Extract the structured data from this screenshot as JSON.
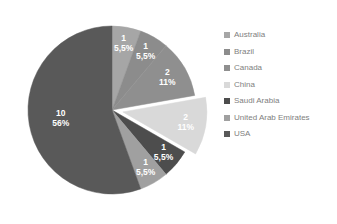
{
  "chart_data": {
    "type": "pie",
    "title": "",
    "subtitle": "",
    "xlabel": "",
    "ylabel": "",
    "legend_position": "right",
    "grid": false,
    "total": 18,
    "categories": [
      "Australia",
      "Brazil",
      "Canada",
      "China",
      "Saudi Arabia",
      "United Arab Emirates",
      "USA"
    ],
    "values": [
      1,
      1,
      2,
      2,
      1,
      1,
      10
    ],
    "percent_labels": [
      "5,5%",
      "5,5%",
      "11%",
      "11%",
      "5,5%",
      "5,5%",
      "56%"
    ],
    "value_labels": [
      "1",
      "1",
      "2",
      "2",
      "1",
      "1",
      "10"
    ],
    "colors": [
      "#a6a6a6",
      "#8c8c8c",
      "#8f8f8f",
      "#d9d9d9",
      "#4d4d4d",
      "#a0a0a0",
      "#595959"
    ],
    "slices": [
      {
        "name": "Australia",
        "value": 1,
        "percent": "5,5%",
        "color": "#a6a6a6",
        "exploded": false
      },
      {
        "name": "Brazil",
        "value": 1,
        "percent": "5,5%",
        "color": "#8c8c8c",
        "exploded": false
      },
      {
        "name": "Canada",
        "value": 2,
        "percent": "11%",
        "color": "#8f8f8f",
        "exploded": false
      },
      {
        "name": "China",
        "value": 2,
        "percent": "11%",
        "color": "#d9d9d9",
        "exploded": true
      },
      {
        "name": "Saudi Arabia",
        "value": 1,
        "percent": "5,5%",
        "color": "#4d4d4d",
        "exploded": false
      },
      {
        "name": "United Arab Emirates",
        "value": 1,
        "percent": "5,5%",
        "color": "#a0a0a0",
        "exploded": false
      },
      {
        "name": "USA",
        "value": 10,
        "percent": "56%",
        "color": "#595959",
        "exploded": false
      }
    ]
  },
  "legend": {
    "items": [
      {
        "label": "Australia",
        "color": "#a6a6a6"
      },
      {
        "label": "Brazil",
        "color": "#8c8c8c"
      },
      {
        "label": "Canada",
        "color": "#8f8f8f"
      },
      {
        "label": "China",
        "color": "#d9d9d9"
      },
      {
        "label": "Saudi Arabia",
        "color": "#4d4d4d"
      },
      {
        "label": "United Arab Emirates",
        "color": "#a0a0a0"
      },
      {
        "label": "USA",
        "color": "#595959"
      }
    ]
  }
}
